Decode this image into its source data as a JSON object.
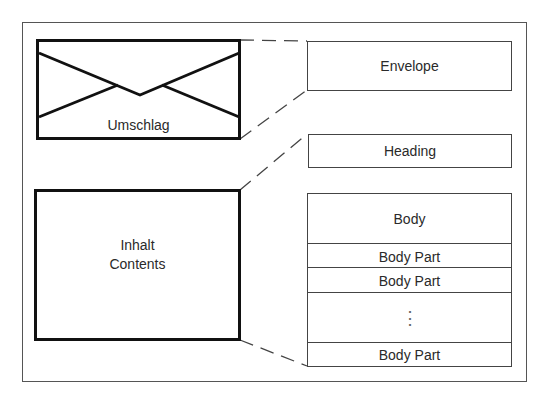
{
  "left": {
    "envelope_label": "Umschlag",
    "contents_label_de": "Inhalt",
    "contents_label_en": "Contents"
  },
  "right": {
    "envelope": "Envelope",
    "heading": "Heading",
    "body": "Body",
    "body_parts": [
      "Body Part",
      "Body Part",
      "Body Part"
    ],
    "ellipsis": "⋮"
  }
}
